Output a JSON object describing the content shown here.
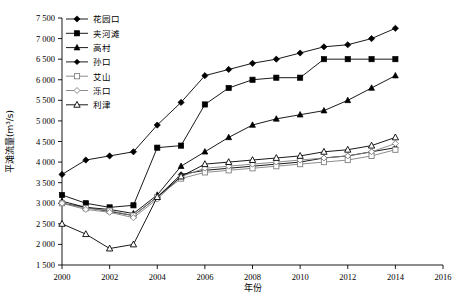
{
  "chart_data": {
    "type": "line",
    "title": "",
    "xlabel": "年份",
    "ylabel": "平滩流量(m³/s)",
    "xlim": [
      2000,
      2016
    ],
    "ylim": [
      1500,
      7500
    ],
    "ytick_step": 500,
    "xtick_step": 2,
    "grid": false,
    "legend_position": "top-left",
    "x": [
      2000,
      2001,
      2002,
      2003,
      2004,
      2005,
      2006,
      2007,
      2008,
      2009,
      2010,
      2011,
      2012,
      2013,
      2014
    ],
    "xticklabels": [
      "2000",
      "2002",
      "2004",
      "2006",
      "2008",
      "2010",
      "2012",
      "2014",
      "2016"
    ],
    "yticklabels": [
      "1 500",
      "2 000",
      "2 500",
      "3 000",
      "3 500",
      "4 000",
      "4 500",
      "5 000",
      "5 500",
      "6 000",
      "6 500",
      "7 000",
      "7 500"
    ],
    "series": [
      {
        "name": "花园口",
        "marker": "diamond-filled",
        "color": "#000000",
        "values": [
          3700,
          4050,
          4150,
          4250,
          4900,
          5450,
          6100,
          6250,
          6400,
          6500,
          6650,
          6800,
          6850,
          7000,
          7250
        ]
      },
      {
        "name": "夹河滩",
        "marker": "square-filled",
        "color": "#000000",
        "values": [
          3200,
          3000,
          2900,
          2950,
          4350,
          4400,
          5400,
          5800,
          6000,
          6050,
          6050,
          6500,
          6500,
          6500,
          6500
        ]
      },
      {
        "name": "高村",
        "marker": "triangle-filled",
        "color": "#000000",
        "values": [
          3050,
          2900,
          2850,
          2750,
          3200,
          3900,
          4250,
          4600,
          4900,
          5050,
          5150,
          5250,
          5500,
          5800,
          6100
        ]
      },
      {
        "name": "孙口",
        "marker": "diamond-filled-small",
        "color": "#000000",
        "values": [
          3000,
          2900,
          2800,
          2700,
          3150,
          3700,
          3800,
          3850,
          3900,
          3950,
          4000,
          4100,
          4150,
          4250,
          4350
        ]
      },
      {
        "name": "艾山",
        "marker": "square-open",
        "color": "#808080",
        "values": [
          3000,
          2880,
          2820,
          2700,
          3150,
          3600,
          3750,
          3800,
          3850,
          3900,
          3950,
          4000,
          4050,
          4150,
          4300
        ]
      },
      {
        "name": "泺口",
        "marker": "diamond-open",
        "color": "#808080",
        "values": [
          3000,
          2850,
          2780,
          2650,
          3100,
          3650,
          3850,
          3900,
          3950,
          4000,
          4050,
          4100,
          4150,
          4250,
          4450
        ]
      },
      {
        "name": "利津",
        "marker": "triangle-open",
        "color": "#000000",
        "values": [
          2500,
          2250,
          1900,
          2000,
          3150,
          3650,
          3950,
          4000,
          4050,
          4100,
          4150,
          4250,
          4300,
          4400,
          4600
        ]
      }
    ]
  }
}
